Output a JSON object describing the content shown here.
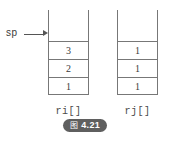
{
  "figure": {
    "pointer": {
      "label": "sp",
      "arrow_icon": "arrow-right-icon",
      "points_to": "ri[]"
    },
    "stacks": [
      {
        "id": "ri",
        "name": "ri[]",
        "capacity": 5,
        "cells": [
          "3",
          "2",
          "1"
        ]
      },
      {
        "id": "rj",
        "name": "rj[]",
        "capacity": 5,
        "cells": [
          "1",
          "1",
          "1"
        ]
      }
    ],
    "caption": {
      "glyph": "图",
      "number": "4.21",
      "full": "图 4.21"
    },
    "colors": {
      "line": "#777777",
      "text": "#3a3a3a",
      "caption_bg": "#5f5f5f",
      "caption_fg": "#ffffff",
      "background": "#ffffff"
    }
  }
}
